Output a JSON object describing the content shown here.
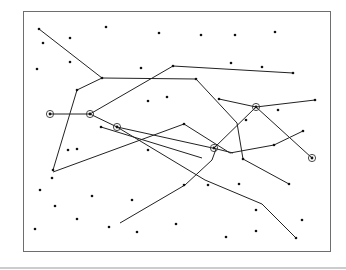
{
  "diagram": {
    "frame": {
      "x": 23,
      "y": 11,
      "width": 307,
      "height": 240
    },
    "rule": {
      "x1": 0,
      "y1": 268,
      "x2": 346,
      "y2": 268
    },
    "paths": [
      [
        [
          39,
          29
        ],
        [
          102,
          78
        ],
        [
          196,
          79
        ],
        [
          237,
          123
        ],
        [
          243,
          159
        ],
        [
          289,
          184
        ]
      ],
      [
        [
          102,
          78
        ],
        [
          77,
          90
        ],
        [
          53,
          170
        ]
      ],
      [
        [
          173,
          66
        ],
        [
          293,
          73
        ]
      ],
      [
        [
          50,
          114
        ],
        [
          90,
          114
        ],
        [
          173,
          66
        ]
      ],
      [
        [
          90,
          114
        ],
        [
          117,
          127
        ],
        [
          217,
          149
        ],
        [
          233,
          153
        ]
      ],
      [
        [
          53,
          172
        ],
        [
          184,
          124
        ],
        [
          230,
          153
        ],
        [
          274,
          145
        ],
        [
          303,
          131
        ]
      ],
      [
        [
          101,
          127
        ],
        [
          202,
          158
        ]
      ],
      [
        [
          117,
          127
        ],
        [
          205,
          180
        ],
        [
          262,
          204
        ],
        [
          296,
          238
        ]
      ],
      [
        [
          214,
          148
        ],
        [
          256,
          107
        ],
        [
          312,
          158
        ]
      ],
      [
        [
          219,
          99
        ],
        [
          256,
          107
        ],
        [
          315,
          100
        ]
      ],
      [
        [
          120,
          223
        ],
        [
          185,
          185
        ],
        [
          212,
          160
        ],
        [
          216,
          149
        ]
      ]
    ],
    "highlighted_points": [
      [
        50,
        114
      ],
      [
        90,
        114
      ],
      [
        117,
        127
      ],
      [
        214,
        148
      ],
      [
        256,
        107
      ],
      [
        312,
        158
      ]
    ],
    "points": [
      [
        39,
        29
      ],
      [
        43,
        43
      ],
      [
        70,
        38
      ],
      [
        106,
        27
      ],
      [
        159,
        33
      ],
      [
        201,
        35
      ],
      [
        235,
        35
      ],
      [
        275,
        32
      ],
      [
        37,
        69
      ],
      [
        70,
        62
      ],
      [
        141,
        68
      ],
      [
        231,
        63
      ],
      [
        262,
        67
      ],
      [
        173,
        66
      ],
      [
        293,
        73
      ],
      [
        77,
        90
      ],
      [
        102,
        78
      ],
      [
        196,
        79
      ],
      [
        167,
        97
      ],
      [
        148,
        101
      ],
      [
        219,
        99
      ],
      [
        315,
        100
      ],
      [
        278,
        110
      ],
      [
        246,
        120
      ],
      [
        53,
        170
      ],
      [
        77,
        149
      ],
      [
        148,
        150
      ],
      [
        101,
        127
      ],
      [
        184,
        124
      ],
      [
        243,
        159
      ],
      [
        289,
        184
      ],
      [
        274,
        145
      ],
      [
        303,
        131
      ],
      [
        40,
        190
      ],
      [
        55,
        206
      ],
      [
        92,
        196
      ],
      [
        77,
        219
      ],
      [
        132,
        200
      ],
      [
        184,
        185
      ],
      [
        208,
        185
      ],
      [
        239,
        184
      ],
      [
        35,
        229
      ],
      [
        109,
        227
      ],
      [
        137,
        232
      ],
      [
        176,
        224
      ],
      [
        226,
        237
      ],
      [
        256,
        231
      ],
      [
        256,
        210
      ],
      [
        296,
        238
      ],
      [
        302,
        220
      ],
      [
        52,
        178
      ],
      [
        68,
        150
      ],
      [
        148,
        150
      ]
    ]
  }
}
